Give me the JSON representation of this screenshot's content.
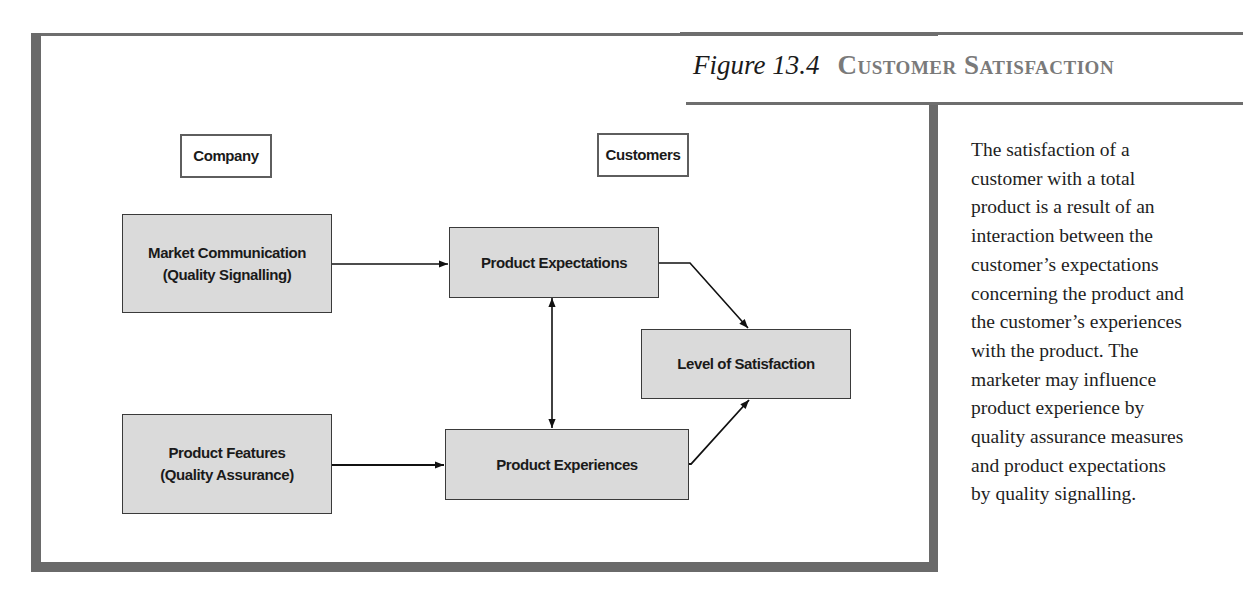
{
  "figure": {
    "number": "Figure 13.4",
    "title": "Customer Satisfaction"
  },
  "caption_lines": [
    "The satisfaction of a",
    "customer with a total",
    "product is a result of an",
    "interaction between the",
    "customer’s expectations",
    "concerning the product and",
    "the customer’s experiences",
    "with the product. The",
    "marketer may influence",
    "product experience by",
    "quality assurance measures",
    "and product expectations",
    "by quality signalling."
  ],
  "diagram": {
    "column_labels": {
      "company": "Company",
      "customers": "Customers"
    },
    "nodes": {
      "market_communication": {
        "line1": "Market Communication",
        "line2": "(Quality Signalling)"
      },
      "product_features": {
        "line1": "Product Features",
        "line2": "(Quality Assurance)"
      },
      "product_expectations": {
        "label": "Product Expectations"
      },
      "product_experiences": {
        "label": "Product Experiences"
      },
      "level_of_satisfaction": {
        "label": "Level of Satisfaction"
      }
    },
    "edges": [
      {
        "from": "Market Communication",
        "to": "Product Expectations",
        "type": "directed"
      },
      {
        "from": "Product Features",
        "to": "Product Experiences",
        "type": "directed"
      },
      {
        "from": "Product Expectations",
        "to": "Product Experiences",
        "type": "bidirectional"
      },
      {
        "from": "Product Expectations",
        "to": "Level of Satisfaction",
        "type": "directed"
      },
      {
        "from": "Product Experiences",
        "to": "Level of Satisfaction",
        "type": "directed"
      }
    ]
  },
  "colors": {
    "frame": "#6a6a6a",
    "box_fill": "#dadada",
    "title_gray": "#7a7a7a"
  }
}
